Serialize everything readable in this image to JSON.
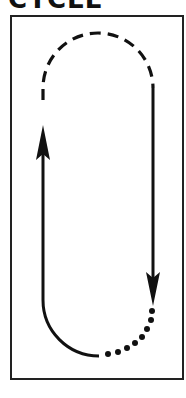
{
  "title": "CYCLE",
  "diagram": {
    "type": "loop-path",
    "frame_color": "#222222",
    "stroke_color": "#111111",
    "segments": [
      {
        "name": "top-arc",
        "style": "dashed"
      },
      {
        "name": "right-straight",
        "style": "solid",
        "direction": "down"
      },
      {
        "name": "bottom-right-arc",
        "style": "dotted"
      },
      {
        "name": "bottom-left-arc",
        "style": "solid"
      },
      {
        "name": "left-straight",
        "style": "solid",
        "direction": "up"
      }
    ]
  }
}
